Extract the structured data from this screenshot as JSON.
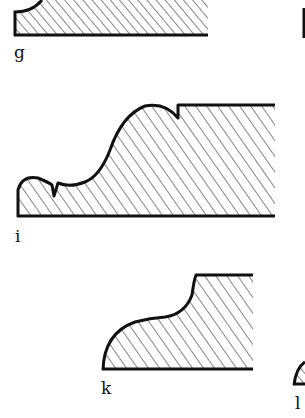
{
  "figure": {
    "background": "#ffffff",
    "ink": "#111111",
    "profiles": [
      {
        "id": "g",
        "label": "g"
      },
      {
        "id": "i",
        "label": "i"
      },
      {
        "id": "k",
        "label": "k"
      },
      {
        "id": "l",
        "label": "l"
      }
    ]
  }
}
